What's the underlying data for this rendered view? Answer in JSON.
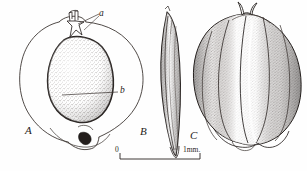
{
  "plate": {
    "background_color": "#fefefe",
    "ink_color": "#2a2422",
    "width": 307,
    "height": 171
  },
  "figures": [
    {
      "id": "figure-a",
      "label": "A",
      "label_x": 27,
      "label_y": 130,
      "description": "outline view of fruit with enclosed stippled seed"
    },
    {
      "id": "figure-b",
      "label": "B",
      "label_x": 142,
      "label_y": 129,
      "description": "narrow lateral edge view"
    },
    {
      "id": "figure-c",
      "label": "C",
      "label_x": 192,
      "label_y": 134,
      "description": "shaded ribbed fruit with style remnant"
    }
  ],
  "callouts": [
    {
      "id": "callout-a",
      "label": "a",
      "label_x": 100,
      "label_y": 13,
      "description": "leader line to apex / style remnant"
    },
    {
      "id": "callout-b",
      "label": "b",
      "label_x": 121,
      "label_y": 90,
      "description": "leader line to seed body"
    }
  ],
  "scale_bar": {
    "zero_label": "0",
    "max_label": "1mm.",
    "zero_label_x": 116,
    "zero_label_y": 150,
    "max_label_x": 186,
    "max_label_y": 151,
    "bar_start_x": 120,
    "bar_end_x": 200,
    "bar_y": 159,
    "tick_height": 6,
    "units": "mm"
  }
}
